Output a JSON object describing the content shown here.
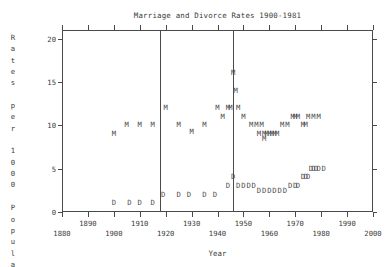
{
  "chart_data": {
    "type": "scatter",
    "title": "Marriage and Divorce Rates 1900-1981",
    "xlabel": "Year",
    "ylabel": "Rates per 1000 Popula",
    "xlim": [
      1880,
      2000
    ],
    "ylim": [
      0,
      21
    ],
    "grid": false,
    "legend": "none",
    "xticks": [
      1880,
      1890,
      1900,
      1910,
      1920,
      1930,
      1940,
      1950,
      1960,
      1970,
      1980,
      1990,
      2000
    ],
    "yticks": [
      0,
      5,
      10,
      15,
      20
    ],
    "marker_labels": {
      "marriage": "M",
      "divorce": "D"
    },
    "annotations": [
      {
        "name": "wwi-line",
        "x": 1918,
        "kind": "vertical-line"
      },
      {
        "name": "wwii-line",
        "x": 1946,
        "kind": "vertical-line"
      }
    ],
    "series": [
      {
        "name": "Marriage rate",
        "marker": "M",
        "points": [
          [
            1900,
            9.0
          ],
          [
            1905,
            10.0
          ],
          [
            1910,
            10.0
          ],
          [
            1915,
            10.0
          ],
          [
            1920,
            12.0
          ],
          [
            1925,
            10.0
          ],
          [
            1930,
            9.2
          ],
          [
            1935,
            10.0
          ],
          [
            1940,
            12.0
          ],
          [
            1942,
            11.0
          ],
          [
            1944,
            12.0
          ],
          [
            1945,
            12.0
          ],
          [
            1946,
            16.0
          ],
          [
            1947,
            14.0
          ],
          [
            1948,
            12.0
          ],
          [
            1950,
            11.0
          ],
          [
            1953,
            10.0
          ],
          [
            1955,
            10.0
          ],
          [
            1957,
            10.0
          ],
          [
            1956,
            9.0
          ],
          [
            1958,
            9.0
          ],
          [
            1959,
            9.0
          ],
          [
            1960,
            9.0
          ],
          [
            1958,
            8.4
          ],
          [
            1961,
            9.0
          ],
          [
            1962,
            9.0
          ],
          [
            1963,
            9.0
          ],
          [
            1965,
            10.0
          ],
          [
            1967,
            10.0
          ],
          [
            1969,
            11.0
          ],
          [
            1970,
            11.0
          ],
          [
            1971,
            11.0
          ],
          [
            1973,
            10.0
          ],
          [
            1974,
            10.0
          ],
          [
            1975,
            11.0
          ],
          [
            1977,
            11.0
          ],
          [
            1979,
            11.0
          ]
        ]
      },
      {
        "name": "Divorce rate",
        "marker": "D",
        "points": [
          [
            1900,
            1.0
          ],
          [
            1906,
            1.0
          ],
          [
            1910,
            1.0
          ],
          [
            1915,
            1.0
          ],
          [
            1919,
            2.0
          ],
          [
            1925,
            2.0
          ],
          [
            1929,
            2.0
          ],
          [
            1935,
            2.0
          ],
          [
            1939,
            2.0
          ],
          [
            1944,
            3.0
          ],
          [
            1946,
            4.0
          ],
          [
            1948,
            3.0
          ],
          [
            1950,
            3.0
          ],
          [
            1952,
            3.0
          ],
          [
            1954,
            3.0
          ],
          [
            1956,
            2.4
          ],
          [
            1958,
            2.4
          ],
          [
            1960,
            2.4
          ],
          [
            1962,
            2.4
          ],
          [
            1964,
            2.4
          ],
          [
            1966,
            2.4
          ],
          [
            1968,
            3.0
          ],
          [
            1970,
            3.0
          ],
          [
            1971,
            3.0
          ],
          [
            1973,
            4.0
          ],
          [
            1974,
            4.0
          ],
          [
            1975,
            4.0
          ],
          [
            1976,
            5.0
          ],
          [
            1977,
            5.0
          ],
          [
            1978,
            5.0
          ],
          [
            1979,
            5.0
          ],
          [
            1981,
            5.0
          ]
        ]
      }
    ]
  }
}
